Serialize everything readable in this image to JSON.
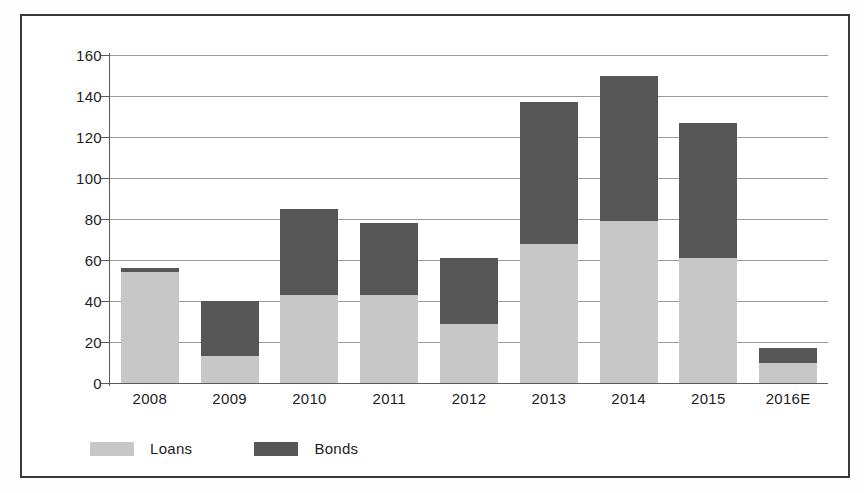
{
  "chart_data": {
    "type": "bar",
    "subtype": "stacked-bar",
    "title": "",
    "xlabel": "",
    "ylabel": "",
    "ylim": [
      0,
      160
    ],
    "ytick_step": 20,
    "yticks": [
      0,
      20,
      40,
      60,
      80,
      100,
      120,
      140,
      160
    ],
    "ytick_labels": [
      "0",
      "20",
      "40",
      "60",
      "80",
      "100",
      "120",
      "140",
      "160"
    ],
    "grid": true,
    "grid_axis": "y",
    "legend_position": "bottom-left",
    "categories": [
      "2008",
      "2009",
      "2010",
      "2011",
      "2012",
      "2013",
      "2014",
      "2015",
      "2016E"
    ],
    "series": [
      {
        "name": "Loans",
        "color": "#c7c7c7",
        "values": [
          54,
          13,
          43,
          43,
          29,
          68,
          79,
          61,
          10
        ]
      },
      {
        "name": "Bonds",
        "color": "#565656",
        "values": [
          2,
          27,
          42,
          35,
          32,
          69,
          71,
          66,
          7
        ]
      }
    ],
    "totals": [
      56,
      40,
      85,
      78,
      61,
      137,
      150,
      127,
      17
    ]
  },
  "legend": {
    "items": [
      {
        "label": "Loans",
        "color": "#c7c7c7"
      },
      {
        "label": "Bonds",
        "color": "#565656"
      }
    ]
  },
  "colors": {
    "loans": "#c7c7c7",
    "bonds": "#565656",
    "gridline": "#9a9a9a",
    "axis": "#5a5a5a",
    "frame": "#3a3a3a",
    "text": "#1d1d1d",
    "background": "#ffffff"
  }
}
